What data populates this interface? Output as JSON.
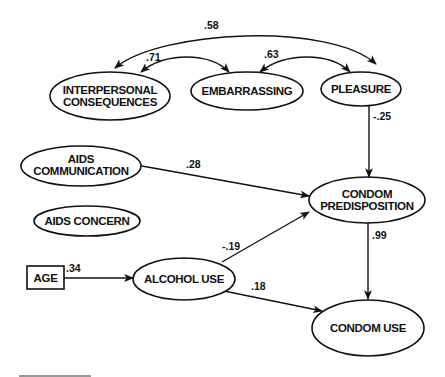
{
  "diagram": {
    "type": "path-model",
    "nodes": {
      "interpersonal": {
        "line1": "INTERPERSONAL",
        "line2": "CONSEQUENCES",
        "shape": "ellipse"
      },
      "embarrassing": {
        "label": "EMBARRASSING",
        "shape": "ellipse"
      },
      "pleasure": {
        "label": "PLEASURE",
        "shape": "ellipse"
      },
      "aids_communication": {
        "line1": "AIDS",
        "line2": "COMMUNICATION",
        "shape": "ellipse"
      },
      "aids_concern": {
        "label": "AIDS CONCERN",
        "shape": "ellipse"
      },
      "condom_predisposition": {
        "line1": "CONDOM",
        "line2": "PREDISPOSITION",
        "shape": "ellipse"
      },
      "age": {
        "label": "AGE",
        "shape": "rectangle"
      },
      "alcohol_use": {
        "label": "ALCOHOL USE",
        "shape": "ellipse"
      },
      "condom_use": {
        "label": "CONDOM USE",
        "shape": "ellipse"
      }
    },
    "edges": {
      "interpersonal_pleasure": {
        "from": "INTERPERSONAL CONSEQUENCES",
        "to": "PLEASURE",
        "type": "correlation",
        "value": ".58"
      },
      "interpersonal_embarrassing": {
        "from": "INTERPERSONAL CONSEQUENCES",
        "to": "EMBARRASSING",
        "type": "correlation",
        "value": ".71"
      },
      "embarrassing_pleasure": {
        "from": "EMBARRASSING",
        "to": "PLEASURE",
        "type": "correlation",
        "value": ".63"
      },
      "pleasure_predisposition": {
        "from": "PLEASURE",
        "to": "CONDOM PREDISPOSITION",
        "type": "path",
        "value": "-.25"
      },
      "communication_predisposition": {
        "from": "AIDS COMMUNICATION",
        "to": "CONDOM PREDISPOSITION",
        "type": "path",
        "value": ".28"
      },
      "alcohol_predisposition": {
        "from": "ALCOHOL USE",
        "to": "CONDOM PREDISPOSITION",
        "type": "path",
        "value": "-.19"
      },
      "predisposition_condomuse": {
        "from": "CONDOM PREDISPOSITION",
        "to": "CONDOM USE",
        "type": "path",
        "value": ".99"
      },
      "age_alcohol": {
        "from": "AGE",
        "to": "ALCOHOL USE",
        "type": "path",
        "value": ".34"
      },
      "alcohol_condomuse": {
        "from": "ALCOHOL USE",
        "to": "CONDOM USE",
        "type": "path",
        "value": ".18"
      }
    }
  }
}
